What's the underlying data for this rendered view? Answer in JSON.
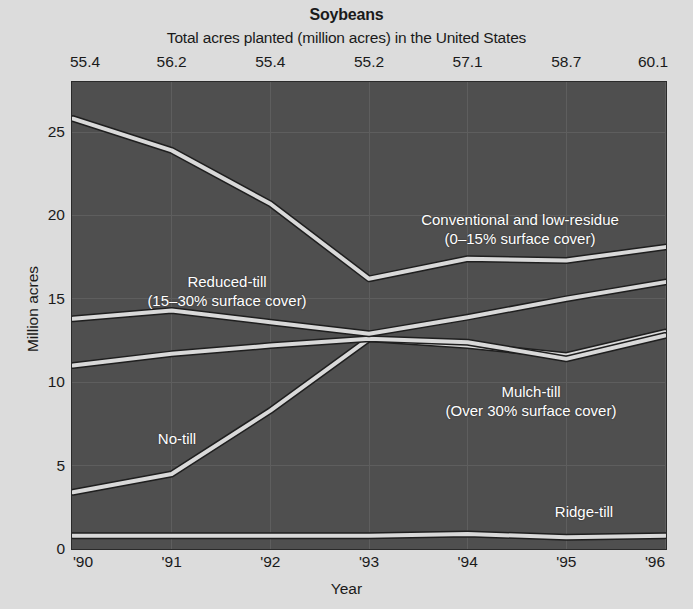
{
  "header": {
    "title": "Soybeans",
    "subtitle": "Total acres planted (million acres) in the United States"
  },
  "chart_data": {
    "type": "line",
    "title": "Soybeans",
    "subtitle": "Total acres planted (million acres) in the United States",
    "xlabel": "Year",
    "ylabel": "Million acres",
    "x": [
      "'90",
      "'91",
      "'92",
      "'93",
      "'94",
      "'95",
      "'96"
    ],
    "xtick_labels": [
      "'90",
      "'91",
      "'92",
      "'93",
      "'94",
      "'95",
      "'96"
    ],
    "ytick_labels": [
      "0",
      "5",
      "10",
      "15",
      "20",
      "25"
    ],
    "ytick_values": [
      0,
      5,
      10,
      15,
      20,
      25
    ],
    "ylim": [
      0,
      28
    ],
    "grid": true,
    "legend": "in-plot annotations",
    "top_axis_label": "Total acres planted (million acres) in the United States",
    "top_axis_values": [
      "55.4",
      "56.2",
      "55.4",
      "55.2",
      "57.1",
      "58.7",
      "60.1"
    ],
    "series": [
      {
        "name": "Conventional and low-residue",
        "sublabel": "(0–15% surface cover)",
        "values": [
          25.8,
          23.9,
          20.7,
          16.2,
          17.4,
          17.3,
          18.1
        ]
      },
      {
        "name": "Reduced-till",
        "sublabel": "(15–30% surface cover)",
        "values": [
          13.8,
          14.3,
          13.6,
          12.9,
          13.9,
          15.0,
          16.0
        ]
      },
      {
        "name": "Mulch-till",
        "sublabel": "(Over 30% surface cover)",
        "values": [
          11.0,
          11.7,
          12.2,
          12.6,
          12.4,
          11.4,
          12.8
        ]
      },
      {
        "name": "No-till",
        "sublabel": "",
        "values": [
          3.4,
          4.5,
          8.3,
          12.6,
          12.2,
          11.6,
          13.0
        ]
      },
      {
        "name": "Ridge-till",
        "sublabel": "",
        "values": [
          0.8,
          0.8,
          0.8,
          0.8,
          0.9,
          0.7,
          0.8
        ]
      }
    ],
    "colors": {
      "plot_background": "#4f4f4f",
      "page_background": "#dcdcdc",
      "line": "#d9d9d9",
      "line_shadow": "#1f1f1f",
      "gridline": "#5e5e5e",
      "label_text": "#ffffff",
      "axis_text": "#1a1a1a"
    },
    "annotations": [
      {
        "id": "conventional",
        "line1": "Conventional and low-residue",
        "line2": "(0–15% surface cover)"
      },
      {
        "id": "reduced-till",
        "line1": "Reduced-till",
        "line2": "(15–30% surface cover)"
      },
      {
        "id": "mulch-till",
        "line1": "Mulch-till",
        "line2": "(Over 30% surface cover)"
      },
      {
        "id": "no-till",
        "line1": "No-till",
        "line2": ""
      },
      {
        "id": "ridge-till",
        "line1": "Ridge-till",
        "line2": ""
      }
    ]
  }
}
